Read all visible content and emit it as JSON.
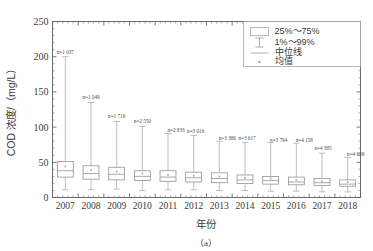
{
  "chart_data": {
    "type": "box",
    "title": "",
    "xlabel": "年份",
    "ylabel": "COD 浓度/（mg/L）",
    "ylim": [
      0,
      250
    ],
    "ytick_labels": [
      "0",
      "50",
      "100",
      "150",
      "200",
      "250"
    ],
    "ytick_values": [
      0,
      50,
      100,
      150,
      200,
      250
    ],
    "y_minor_step": 10,
    "grid": false,
    "categories": [
      "2007",
      "2008",
      "2009",
      "2010",
      "2011",
      "2012",
      "2013",
      "2014",
      "2015",
      "2016",
      "2017",
      "2018"
    ],
    "legend_position": "top-right",
    "legend": [
      {
        "key": "box",
        "label": "25%～75%"
      },
      {
        "key": "whisker",
        "label": "1%～99%"
      },
      {
        "key": "median",
        "label": "中位线"
      },
      {
        "key": "mean",
        "label": "均值"
      }
    ],
    "annotations": [
      "n=1 037",
      "n=1 049",
      "n=1 716",
      "n=2 550",
      "n=2 833",
      "n=3 016",
      "n=3 386",
      "n=3 617",
      "n=3 794",
      "n=4 158",
      "n=4 385",
      "n=4 698"
    ],
    "boxes": [
      {
        "category": "2007",
        "n": 1037,
        "p1": 11,
        "q1": 29,
        "median": 38,
        "mean": 44,
        "q3": 51,
        "p99": 200
      },
      {
        "category": "2008",
        "n": 1049,
        "p1": 11,
        "q1": 26,
        "median": 34,
        "mean": 39,
        "q3": 45,
        "p99": 135
      },
      {
        "category": "2009",
        "n": 1716,
        "p1": 12,
        "q1": 25,
        "median": 33,
        "mean": 37,
        "q3": 43,
        "p99": 108
      },
      {
        "category": "2010",
        "n": 2550,
        "p1": 10,
        "q1": 24,
        "median": 30,
        "mean": 34,
        "q3": 38,
        "p99": 101
      },
      {
        "category": "2011",
        "n": 2833,
        "p1": 11,
        "q1": 23,
        "median": 29,
        "mean": 32,
        "q3": 38,
        "p99": 91
      },
      {
        "category": "2012",
        "n": 3016,
        "p1": 11,
        "q1": 22,
        "median": 28,
        "mean": 31,
        "q3": 36,
        "p99": 88
      },
      {
        "category": "2013",
        "n": 3386,
        "p1": 10,
        "q1": 21,
        "median": 27,
        "mean": 30,
        "q3": 35,
        "p99": 80
      },
      {
        "category": "2014",
        "n": 3617,
        "p1": 10,
        "q1": 20,
        "median": 25,
        "mean": 28,
        "q3": 32,
        "p99": 78
      },
      {
        "category": "2015",
        "n": 3794,
        "p1": 9,
        "q1": 19,
        "median": 24,
        "mean": 27,
        "q3": 30,
        "p99": 78
      },
      {
        "category": "2016",
        "n": 4158,
        "p1": 9,
        "q1": 18,
        "median": 22,
        "mean": 25,
        "q3": 29,
        "p99": 77
      },
      {
        "category": "2017",
        "n": 4385,
        "p1": 8,
        "q1": 17,
        "median": 21,
        "mean": 23,
        "q3": 27,
        "p99": 63
      },
      {
        "category": "2018",
        "n": 4698,
        "p1": 8,
        "q1": 16,
        "median": 19,
        "mean": 22,
        "q3": 25,
        "p99": 57
      }
    ]
  },
  "figure": {
    "caption": "（a）"
  }
}
